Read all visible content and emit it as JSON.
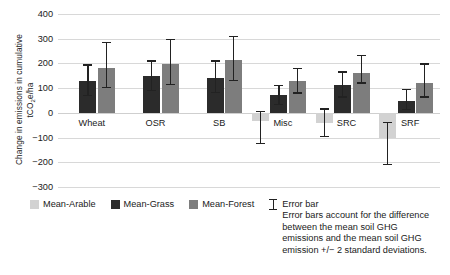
{
  "chart_data": {
    "type": "bar",
    "title": "",
    "xlabel": "",
    "ylabel": "Change in emissions in cumulative tCO2e/ha",
    "ylabel_line1": "Change in emissions in cumulative",
    "ylabel_line2_pre": "tCO",
    "ylabel_line2_sub": "2",
    "ylabel_line2_post": "e/ha",
    "ylim": [
      -300,
      400
    ],
    "ytick_step": 100,
    "yticks": [
      "400",
      "300",
      "200",
      "100",
      "0",
      "−100",
      "−200",
      "−300"
    ],
    "ytick_values": [
      400,
      300,
      200,
      100,
      0,
      -100,
      -200,
      -300
    ],
    "grid": true,
    "legend_position": "below",
    "categories": [
      "Wheat",
      "OSR",
      "SB",
      "Misc",
      "SRC",
      "SRF"
    ],
    "series": [
      {
        "name": "Mean-Arable",
        "color": "#d2d2d2",
        "values": [
          0,
          0,
          0,
          -35,
          -40,
          -100
        ],
        "err_low": [
          0,
          0,
          0,
          -128,
          -98,
          -210
        ],
        "err_high": [
          0,
          0,
          0,
          8,
          18,
          -38
        ]
      },
      {
        "name": "Mean-Grass",
        "color": "#2b2b2b",
        "values": [
          130,
          148,
          142,
          72,
          112,
          48
        ],
        "err_low": [
          68,
          88,
          80,
          30,
          62,
          12
        ],
        "err_high": [
          196,
          212,
          212,
          112,
          168,
          98
        ]
      },
      {
        "name": "Mean-Forest",
        "color": "#7d7d7d",
        "values": [
          182,
          198,
          212,
          130,
          162,
          122
        ],
        "err_low": [
          100,
          112,
          128,
          78,
          118,
          62
        ],
        "err_high": [
          286,
          300,
          312,
          182,
          234,
          200
        ]
      }
    ]
  },
  "legend": {
    "items": [
      {
        "label": "Mean-Arable",
        "color": "#d2d2d2"
      },
      {
        "label": "Mean-Grass",
        "color": "#2b2b2b"
      },
      {
        "label": "Mean-Forest",
        "color": "#7d7d7d"
      }
    ],
    "error_bar_title": "Error bar",
    "error_bar_note": "Error bars account for the difference\nbetween the mean soil GHG\nemissions and the mean soil GHG\nemission +/− 2 standard deviations."
  }
}
